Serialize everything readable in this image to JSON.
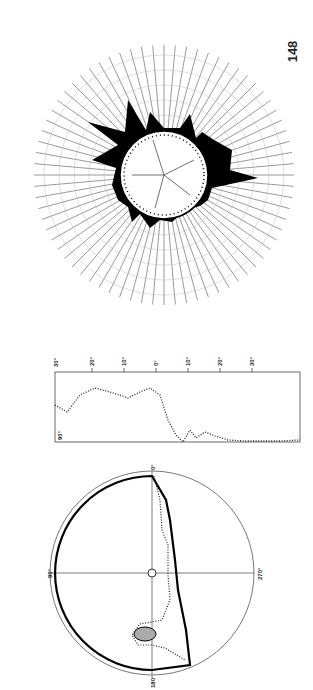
{
  "page": {
    "number": "148",
    "orientation": "rotated-90"
  },
  "figures": {
    "polar_histogram": {
      "description": "Polar rose/histogram with radial grid, black filled lobes around a central dial",
      "fill_color": "#000000",
      "grid_color": "#444444"
    },
    "profile_plot": {
      "corner_label": "90°",
      "x_ticks": [
        "30°",
        "20°",
        "10°",
        "0°",
        "10°",
        "20°",
        "30°"
      ],
      "line_style": "dotted"
    },
    "circle_plot": {
      "labels": {
        "top": "0°",
        "left": "90°",
        "bottom": "180°",
        "right": "270°"
      },
      "outline_style": "solid-thick",
      "inner_style": "dotted",
      "hatched_region_color": "#aaaaaa"
    }
  },
  "chart_data": [
    {
      "type": "line",
      "title": "",
      "xlabel": "angle",
      "ylabel": "",
      "x": [
        -30,
        -25,
        -20,
        -15,
        -10,
        -5,
        0,
        5,
        10,
        15,
        20,
        25,
        30
      ],
      "series": [
        {
          "name": "profile",
          "values": [
            0.55,
            0.45,
            0.9,
            0.85,
            0.8,
            0.88,
            0.7,
            0.1,
            0.02,
            0.06,
            0.03,
            0.05,
            0.02
          ]
        }
      ],
      "tick_labels": [
        "30°",
        "20°",
        "10°",
        "0°",
        "10°",
        "20°",
        "30°"
      ],
      "annotations": [
        "90°"
      ]
    },
    {
      "type": "polar",
      "title": "",
      "angle_labels": [
        "0°",
        "90°",
        "180°",
        "270°"
      ]
    }
  ]
}
